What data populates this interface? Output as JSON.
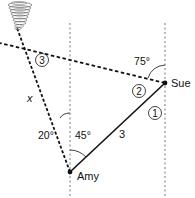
{
  "diagram": {
    "people": {
      "amy": {
        "label": "Amy"
      },
      "sue": {
        "label": "Sue"
      }
    },
    "segments": {
      "amy_sue": {
        "length_label": "3",
        "circle_label": "1"
      },
      "sue_tornado": {
        "circle_label": "2"
      },
      "amy_tornado": {
        "length_label": "x",
        "circle_label": "3"
      }
    },
    "angles": {
      "amy_left": "20°",
      "amy_right": "45°",
      "sue_top": "75°"
    },
    "icons": {
      "tornado": "tornado-icon"
    },
    "colors": {
      "ink": "#111111",
      "guide": "#555555"
    }
  }
}
